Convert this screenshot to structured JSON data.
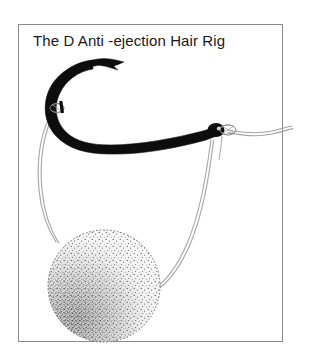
{
  "figure": {
    "title": "The D  Anti -ejection Hair Rig",
    "frame": {
      "border_color": "#8a8a8a",
      "background_color": "#ffffff",
      "x": 18,
      "y": 24,
      "width": 265,
      "height": 318
    },
    "canvas": {
      "width": 309,
      "height": 360,
      "background_color": "#ffffff"
    },
    "parts": [
      {
        "name": "hook",
        "label": "Fishing hook",
        "color": "#0d0d0d",
        "description": "Heavy black curved hook with barbed point at upper left and eye at right end of shank"
      },
      {
        "name": "hook-point",
        "label": "Hook point and barb",
        "color": "#0d0d0d"
      },
      {
        "name": "hook-eye",
        "label": "Hook eye",
        "color": "#0d0d0d"
      },
      {
        "name": "d-loop-knot",
        "label": "Knot on hook shank forming the D",
        "color": "#555555"
      },
      {
        "name": "knotless-knot",
        "label": "Knot at hook eye",
        "color": "#555555"
      },
      {
        "name": "hook-length",
        "label": "Hooklink to mainline",
        "color": "#9a9a9a"
      },
      {
        "name": "hair",
        "label": "Hair loop from the D to the bait",
        "color": "#a5a5a5"
      },
      {
        "name": "bait",
        "label": "Boilie bait",
        "color": "#4a4a4a",
        "shading": "stippled, denser at lower left"
      }
    ],
    "colors": {
      "ink": "#0d0d0d",
      "line": "#9e9e9e",
      "stipple": "#3c3c3c",
      "frame": "#8a8a8a",
      "paper": "#ffffff"
    }
  }
}
